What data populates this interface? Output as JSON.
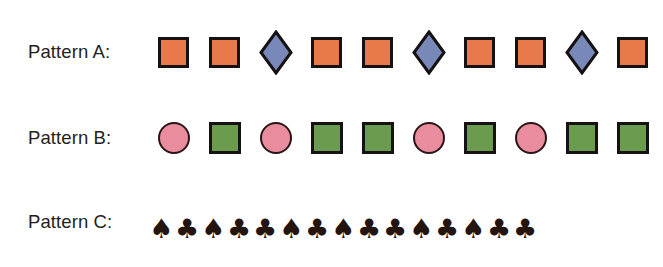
{
  "colors": {
    "background": "#ffffff",
    "text": "#231f20",
    "orange": "#e8794a",
    "blue": "#7888b8",
    "pink": "#e88c9e",
    "green": "#6a9b4e",
    "outline": "#161113",
    "suit": "#231410"
  },
  "rows": [
    {
      "label": "Pattern A:",
      "shapes": [
        "square-orange",
        "square-orange",
        "diamond-blue",
        "square-orange",
        "square-orange",
        "diamond-blue",
        "square-orange",
        "square-orange",
        "diamond-blue",
        "square-orange"
      ]
    },
    {
      "label": "Pattern B:",
      "shapes": [
        "circle-pink",
        "square-green",
        "circle-pink",
        "square-green",
        "square-green",
        "circle-pink",
        "square-green",
        "circle-pink",
        "square-green",
        "square-green"
      ]
    },
    {
      "label": "Pattern C:",
      "shapes": [
        "spade",
        "club",
        "spade",
        "club",
        "club",
        "spade",
        "club",
        "spade",
        "club",
        "club",
        "spade",
        "club",
        "spade",
        "club",
        "club"
      ],
      "glyphs": {
        "spade": "♠",
        "club": "♣"
      }
    }
  ]
}
